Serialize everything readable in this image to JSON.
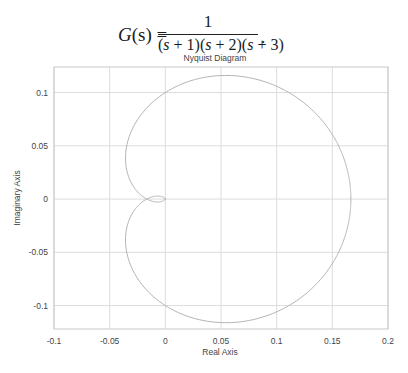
{
  "equation": {
    "lhs_func": "G",
    "lhs_arg": "(s) =",
    "numerator": "1",
    "denominator_parts": [
      "(",
      "s",
      " + 1)(",
      "s",
      " + 2)(",
      "s",
      " + 3)"
    ],
    "trailing": "."
  },
  "chart_data": {
    "type": "line",
    "title": "Nyquist Diagram",
    "xlabel": "Real Axis",
    "ylabel": "Imaginary Axis",
    "xlim": [
      -0.1,
      0.2
    ],
    "ylim": [
      -0.122,
      0.124
    ],
    "xticks": [
      -0.1,
      -0.05,
      0,
      0.05,
      0.1,
      0.15,
      0.2
    ],
    "xtick_labels": [
      "-0.1",
      "-0.05",
      "0",
      "0.05",
      "0.1",
      "0.15",
      "0.2"
    ],
    "yticks": [
      -0.1,
      -0.05,
      0,
      0.05,
      0.1
    ],
    "ytick_labels": [
      "-0.1",
      "-0.05",
      "0",
      "0.05",
      "0.1"
    ],
    "grid": true,
    "transfer_function": "1/((s+1)(s+2)(s+3))",
    "series": [
      {
        "name": "G(jw), w from -inf to +inf",
        "description": "Nyquist contour of G(s)=1/((s+1)(s+2)(s+3)); starts at 1/6 on real axis, encircles counter-clockwise, loops near origin",
        "color": "#b0b0b0"
      }
    ],
    "key_points": {
      "dc_gain": [
        0.1667,
        0
      ],
      "real_axis_crossing": [
        -0.0167,
        0
      ],
      "max_imag": [
        0.055,
        0.107
      ],
      "min_imag": [
        0.055,
        -0.107
      ]
    }
  },
  "colors": {
    "grid": "#dcdcdc",
    "axes": "#c8c8c8",
    "curve": "#b4b4b4",
    "text": "#444444"
  }
}
